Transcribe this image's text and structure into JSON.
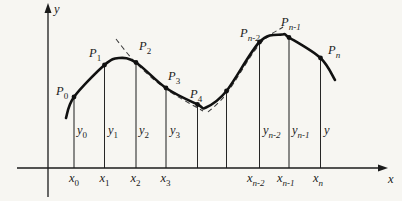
{
  "figure": {
    "background": "#f7f6f2",
    "ink": "#1b1b1b",
    "axes": {
      "y_label": "y",
      "x_label": "x",
      "y_axis": {
        "x": 48,
        "top": 4,
        "bottom": 197
      },
      "x_axis": {
        "y": 168,
        "left": 17,
        "right": 384
      },
      "y_label_pos": {
        "x": 54,
        "y": 13
      },
      "x_label_pos": {
        "x": 388,
        "y": 183
      }
    },
    "curve_points": [
      [
        66,
        118
      ],
      [
        74,
        97
      ],
      [
        104.5,
        65
      ],
      [
        119,
        58
      ],
      [
        136,
        62.5
      ],
      [
        166,
        88
      ],
      [
        197.5,
        104.5
      ],
      [
        206,
        107.5
      ],
      [
        226.5,
        91
      ],
      [
        259.5,
        42
      ],
      [
        282,
        34.5
      ],
      [
        289,
        37.5
      ],
      [
        320.5,
        58
      ],
      [
        335,
        80
      ]
    ],
    "dashed_chords": [
      {
        "name": "chord-through-P2-P3",
        "points": [
          [
            116,
            39
          ],
          [
            136,
            63
          ],
          [
            166,
            89
          ],
          [
            203,
            111
          ]
        ]
      },
      {
        "name": "chord-through-Pn-2",
        "points": [
          [
            208,
            112
          ],
          [
            227,
            93
          ],
          [
            259,
            45
          ],
          [
            283,
            27
          ]
        ]
      }
    ],
    "ordinates": [
      {
        "x": 74,
        "top": 97,
        "dot": true
      },
      {
        "x": 104.5,
        "top": 65,
        "dot": true
      },
      {
        "x": 136,
        "top": 62.5,
        "dot": true
      },
      {
        "x": 166,
        "top": 88,
        "dot": true
      },
      {
        "x": 197.5,
        "top": 104.5,
        "dot": true
      },
      {
        "x": 226.5,
        "top": 91,
        "dot": true
      },
      {
        "x": 259.5,
        "top": 42,
        "dot": true
      },
      {
        "x": 289,
        "top": 37.5,
        "dot": true
      },
      {
        "x": 320.5,
        "top": 58,
        "dot": true
      }
    ],
    "point_labels": [
      {
        "main": "P",
        "sub": "0",
        "x": 56,
        "y": 95
      },
      {
        "main": "P",
        "sub": "1",
        "x": 89,
        "y": 57
      },
      {
        "main": "P",
        "sub": "2",
        "x": 139,
        "y": 50
      },
      {
        "main": "P",
        "sub": "3",
        "x": 168,
        "y": 80
      },
      {
        "main": "P",
        "sub": "4",
        "x": 190,
        "y": 98
      },
      {
        "main": "P",
        "sub": "n-2",
        "x": 240,
        "y": 37
      },
      {
        "main": "P",
        "sub": "n-1",
        "x": 281,
        "y": 26
      },
      {
        "main": "P",
        "sub": "n",
        "x": 328,
        "y": 54
      }
    ],
    "ordinate_labels": [
      {
        "main": "y",
        "sub": "0",
        "x": 77,
        "y": 134
      },
      {
        "main": "y",
        "sub": "1",
        "x": 108,
        "y": 134
      },
      {
        "main": "y",
        "sub": "2",
        "x": 139,
        "y": 134
      },
      {
        "main": "y",
        "sub": "3",
        "x": 170,
        "y": 134
      },
      {
        "main": "y",
        "sub": "n-2",
        "x": 263,
        "y": 134
      },
      {
        "main": "y",
        "sub": "n-1",
        "x": 292,
        "y": 134
      },
      {
        "main": "y",
        "sub": "",
        "x": 324,
        "y": 134
      }
    ],
    "x_tick_labels": [
      {
        "main": "x",
        "sub": "0",
        "x": 69,
        "y": 182
      },
      {
        "main": "x",
        "sub": "1",
        "x": 99.5,
        "y": 182
      },
      {
        "main": "x",
        "sub": "2",
        "x": 130.5,
        "y": 182
      },
      {
        "main": "x",
        "sub": "3",
        "x": 160.5,
        "y": 182
      },
      {
        "main": "x",
        "sub": "n-2",
        "x": 247,
        "y": 182
      },
      {
        "main": "x",
        "sub": "n-1",
        "x": 277,
        "y": 182
      },
      {
        "main": "x",
        "sub": "n",
        "x": 313,
        "y": 182
      }
    ]
  }
}
